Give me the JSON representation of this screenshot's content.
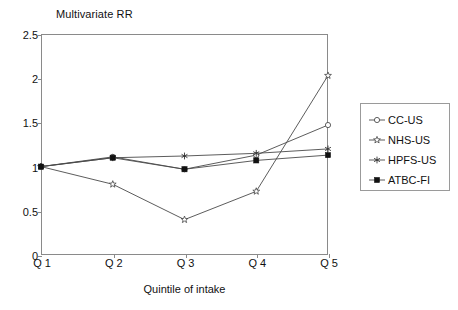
{
  "chart_data": {
    "type": "line",
    "title": "Multivariate RR",
    "xlabel": "Quintile of intake",
    "ylabel": "Multivariate RR",
    "categories": [
      "Q 1",
      "Q 2",
      "Q 3",
      "Q 4",
      "Q 5"
    ],
    "x_tick_labels": [
      "Q 1",
      "Q 2",
      "Q 3",
      "Q 4",
      "Q 5"
    ],
    "y_tick_labels": [
      "0",
      "0.5",
      "1",
      "1.5",
      "2",
      "2.5"
    ],
    "y_tick_values": [
      0,
      0.5,
      1,
      1.5,
      2,
      2.5
    ],
    "ylim": [
      0,
      2.5
    ],
    "xlim": [
      0,
      4
    ],
    "grid": false,
    "legend_position": "right",
    "series": [
      {
        "name": "CC-US",
        "marker": "dot-plus",
        "values": [
          1.0,
          1.11,
          0.97,
          1.13,
          1.47
        ]
      },
      {
        "name": "NHS-US",
        "marker": "open-star",
        "values": [
          1.0,
          0.8,
          0.4,
          0.72,
          2.03
        ]
      },
      {
        "name": "HPFS-US",
        "marker": "asterisk",
        "values": [
          1.0,
          1.1,
          1.12,
          1.15,
          1.2
        ]
      },
      {
        "name": "ATBC-FI",
        "marker": "filled-square",
        "values": [
          1.0,
          1.1,
          0.97,
          1.07,
          1.13
        ]
      }
    ]
  },
  "legend": {
    "entries": [
      {
        "label": "CC-US",
        "marker": "dot-plus"
      },
      {
        "label": "NHS-US",
        "marker": "open-star"
      },
      {
        "label": "HPFS-US",
        "marker": "asterisk"
      },
      {
        "label": "ATBC-FI",
        "marker": "filled-square"
      }
    ]
  },
  "colors": {
    "line": "#4a4a4a",
    "frame": "#8a8a8a",
    "text": "#111111",
    "background": "#ffffff"
  }
}
